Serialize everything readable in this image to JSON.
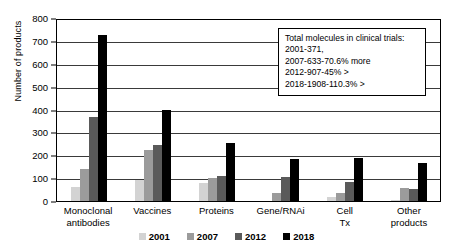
{
  "chart_data": {
    "type": "bar",
    "title": "",
    "xlabel": "",
    "ylabel": "Number of products",
    "ylim": [
      0,
      800
    ],
    "ytick_step": 100,
    "yticks": [
      "800",
      "700",
      "600",
      "500",
      "400",
      "300",
      "200",
      "100",
      "0"
    ],
    "grid": true,
    "legend_position": "bottom",
    "categories": [
      "Monoclonal antibodies",
      "Vaccines",
      "Proteins",
      "Gene/RNAi",
      "Cell Tx",
      "Other products"
    ],
    "series": [
      {
        "name": "2001",
        "color": "#d3d3d3",
        "values": [
          63,
          92,
          78,
          0,
          16,
          4
        ]
      },
      {
        "name": "2007",
        "color": "#9b9b9b",
        "values": [
          140,
          225,
          100,
          35,
          34,
          57
        ]
      },
      {
        "name": "2012",
        "color": "#5a5a5a",
        "values": [
          368,
          245,
          110,
          105,
          82,
          53
        ]
      },
      {
        "name": "2018",
        "color": "#000000",
        "values": [
          725,
          398,
          252,
          185,
          190,
          165
        ]
      }
    ],
    "annotation": {
      "lines": [
        "Total molecules in clinical trials:",
        "2001-371,",
        "2007-633-70.6% more",
        "2012-907-45% >",
        "2018-1908-110.3% >"
      ]
    }
  }
}
